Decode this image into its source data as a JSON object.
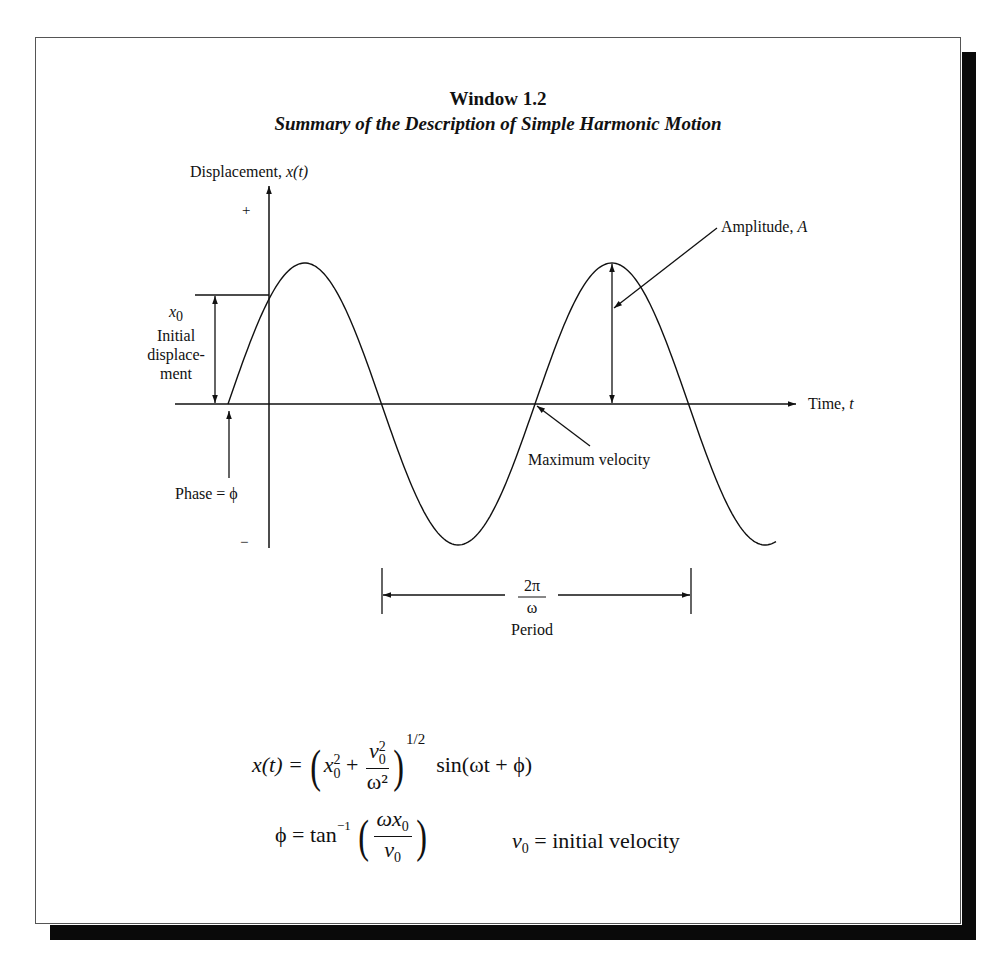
{
  "window": {
    "title": "Window 1.2",
    "subtitle": "Summary of the Description of Simple Harmonic Motion"
  },
  "diagram": {
    "y_axis_label_text": "Displacement, ",
    "y_axis_label_var": "x(t)",
    "y_plus": "+",
    "y_minus": "−",
    "x_axis_label_text": "Time, ",
    "x_axis_label_var": "t",
    "x0_symbol": "x",
    "x0_sub": "0",
    "x0_line1": "Initial",
    "x0_line2": "displace-",
    "x0_line3": "ment",
    "phase_label": "Phase = ϕ",
    "amplitude_label_text": "Amplitude, ",
    "amplitude_label_var": "A",
    "max_velocity_label": "Maximum velocity",
    "period_numerator": "2π",
    "period_denominator": "ω",
    "period_label": "Period"
  },
  "equations": {
    "eq1_lhs": "x(t) = ",
    "eq1_x0": "x",
    "eq1_x0_sup": "2",
    "eq1_x0_sub": "0",
    "eq1_plus": " + ",
    "eq1_num": "v",
    "eq1_num_sup": "2",
    "eq1_num_sub": "0",
    "eq1_den": "ω²",
    "eq1_exp": "1/2",
    "eq1_rhs": "sin(ωt + ϕ)",
    "eq2_lhs": "ϕ = tan",
    "eq2_lhs_sup": "−1",
    "eq2_num": "ωx",
    "eq2_num_sub": "0",
    "eq2_den": "v",
    "eq2_den_sub": "0",
    "eq3_lhs": "v",
    "eq3_lhs_sub": "0",
    "eq3_rhs": " = initial velocity"
  },
  "chart_data": {
    "type": "line",
    "xlabel": "Time, t",
    "ylabel": "Displacement, x(t)",
    "function": "x(t) = A sin(ωt + ϕ)",
    "annotations": [
      "x0 Initial displacement",
      "Phase = ϕ",
      "Amplitude, A",
      "Maximum velocity",
      "2π/ω Period"
    ],
    "y_ticks": [
      "+",
      "−"
    ],
    "grid": false,
    "legend": null
  }
}
